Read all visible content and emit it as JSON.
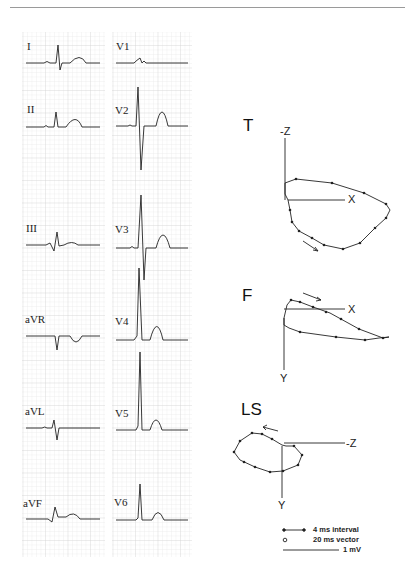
{
  "figure": {
    "ecg_leads_left": [
      "I",
      "II",
      "III",
      "aVR",
      "aVL",
      "aVF"
    ],
    "ecg_leads_right": [
      "V1",
      "V2",
      "V3",
      "V4",
      "V5",
      "V6"
    ],
    "vcg_planes": [
      {
        "title": "T",
        "axes": [
          "-Z",
          "X"
        ]
      },
      {
        "title": "F",
        "axes": [
          "X",
          "Y"
        ]
      },
      {
        "title": "LS",
        "axes": [
          "-Z",
          "Y"
        ]
      }
    ],
    "legend": {
      "interval": "4 ms interval",
      "vector": "20 ms vector",
      "scale": "1 mV"
    }
  }
}
